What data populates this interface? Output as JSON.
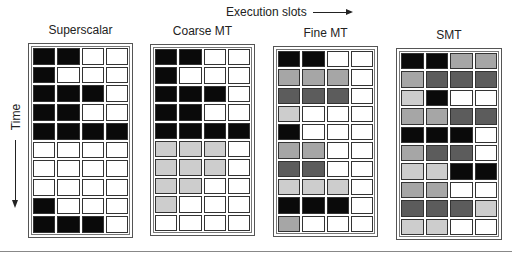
{
  "header": {
    "execution_slots_label": "Execution slots"
  },
  "axis": {
    "time_label": "Time"
  },
  "legend_colors": {
    "B": "#0a0a0a",
    "D": "#5c5c5c",
    "M": "#a6a6a6",
    "L": "#cdcdcd",
    "W": "#ffffff"
  },
  "panels": [
    {
      "title": "Superscalar",
      "rows": [
        "BBWW",
        "BWWW",
        "BBBW",
        "BBWW",
        "BBBB",
        "WWWW",
        "WWWW",
        "WWWW",
        "BWWW",
        "BBBW"
      ]
    },
    {
      "title": "Coarse MT",
      "rows": [
        "BBWW",
        "BWWW",
        "BBBW",
        "BBWW",
        "BBBB",
        "LLLW",
        "LLLW",
        "LLWW",
        "LWWW",
        "WWWW"
      ]
    },
    {
      "title": "Fine MT",
      "rows": [
        "BBWW",
        "MMMW",
        "DDDW",
        "LWWW",
        "BWWW",
        "MMWW",
        "DDWW",
        "LLLW",
        "BBBW",
        "MWWW"
      ]
    },
    {
      "title": "SMT",
      "rows": [
        "BBMM",
        "MDDD",
        "LBWW",
        "MMDD",
        "BBBW",
        "MDDW",
        "LLBB",
        "MMWW",
        "DDDL",
        "LLWW"
      ]
    }
  ]
}
